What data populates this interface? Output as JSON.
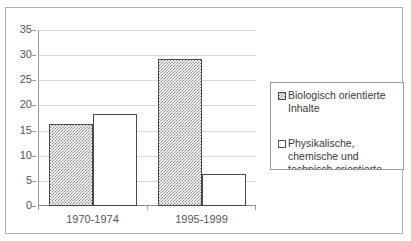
{
  "chart_data": {
    "type": "bar",
    "title": "",
    "subtitle": "",
    "xlabel": "",
    "ylabel": "",
    "categories": [
      "1970-1974",
      "1995-1999"
    ],
    "series": [
      {
        "name": "Biologisch orientierte Inhalte",
        "values": [
          16.3,
          29.2
        ],
        "fill": "checker",
        "swatch_icon": "checker-swatch"
      },
      {
        "name": "Physikalische, chemische und technisch orientierte",
        "values": [
          18.2,
          6.4
        ],
        "fill": "dots",
        "swatch_icon": "empty-swatch"
      }
    ],
    "ylim": [
      0,
      35
    ],
    "yticks": [
      0,
      5,
      10,
      15,
      20,
      25,
      30,
      35
    ],
    "ytick_labels": [
      "0",
      "5",
      "10",
      "15",
      "20",
      "25",
      "30",
      "35"
    ],
    "grid": true,
    "grid_axis": "y",
    "legend_position": "right",
    "legend_clipped": true,
    "colors": {
      "frame_border": "#b0b0b0",
      "gridline": "#d9d9d9",
      "axis": "#9a9a9a",
      "bar_border": "#4a4a4a",
      "tick_label": "#555555",
      "legend_text": "#3a3a3a",
      "legend_border": "#9a9a9a",
      "background": "#ffffff"
    }
  },
  "legend": {
    "entries": [
      {
        "label": "Biologisch orientierte\nInhalte"
      },
      {
        "label": "Physikalische,\nchemische und\ntechnisch orientierte"
      }
    ]
  },
  "axis": {
    "y": {
      "labels": [
        "35",
        "30",
        "25",
        "20",
        "15",
        "10",
        "5",
        "0"
      ]
    },
    "x": {
      "labels": [
        "1970-1974",
        "1995-1999"
      ]
    }
  }
}
